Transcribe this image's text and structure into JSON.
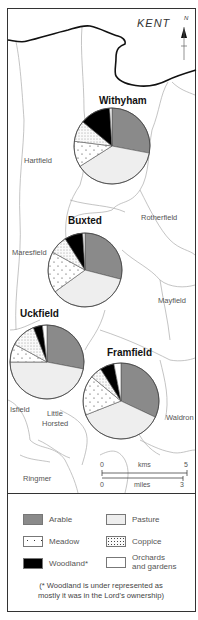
{
  "map": {
    "region_label": "KENT",
    "north_label": "N",
    "place_labels": [
      {
        "name": "Hartfield",
        "x": 24,
        "y": 163
      },
      {
        "name": "Rotherfield",
        "x": 141,
        "y": 220
      },
      {
        "name": "Maresfield",
        "x": 12,
        "y": 255
      },
      {
        "name": "Mayfield",
        "x": 158,
        "y": 303
      },
      {
        "name": "Waldron",
        "x": 166,
        "y": 420
      },
      {
        "name": "Isfield",
        "x": 10,
        "y": 412
      },
      {
        "name": "Little",
        "x": 47,
        "y": 416
      },
      {
        "name": "Horsted",
        "x": 42,
        "y": 426
      },
      {
        "name": "Ringmer",
        "x": 23,
        "y": 481
      }
    ],
    "scale": {
      "kms_label": "kms",
      "kms_start": "0",
      "kms_end": "5",
      "miles_label": "miles",
      "miles_start": "0",
      "miles_end": "3"
    }
  },
  "chart_data": {
    "type": "pie",
    "categories": [
      "Arable",
      "Pasture",
      "Meadow",
      "Coppice",
      "Woodland*",
      "Orchards and gardens"
    ],
    "colors": [
      "#8a8a8a",
      "#eeeeee",
      "#ffffff",
      "#f4f4f4",
      "#000000",
      "#ffffff"
    ],
    "series": [
      {
        "name": "Withyham",
        "values": [
          28,
          38,
          11,
          9,
          13,
          1
        ],
        "cx": 112,
        "cy": 146,
        "r": 38,
        "label_x": 99,
        "label_y": 104
      },
      {
        "name": "Buxted",
        "values": [
          29,
          36,
          18,
          8,
          8,
          1
        ],
        "cx": 85,
        "cy": 270,
        "r": 37,
        "label_x": 68,
        "label_y": 224
      },
      {
        "name": "Uckfield",
        "values": [
          28,
          47,
          8,
          11,
          4,
          2
        ],
        "cx": 47,
        "cy": 362,
        "r": 37,
        "label_x": 20,
        "label_y": 317
      },
      {
        "name": "Framfield",
        "values": [
          32,
          37,
          17,
          5,
          6,
          3
        ],
        "cx": 121,
        "cy": 401,
        "r": 38,
        "label_x": 107,
        "label_y": 356
      }
    ],
    "note": "Values are approximate percentages estimated from slice angles, clockwise from 12 o'clock."
  },
  "legend": {
    "items": [
      {
        "label": "Arable"
      },
      {
        "label": "Pasture"
      },
      {
        "label": "Meadow"
      },
      {
        "label": "Coppice"
      },
      {
        "label": "Woodland*"
      },
      {
        "label": "Orchards"
      },
      {
        "label": "and gardens"
      }
    ],
    "note_line1": "(* Woodland is under represented as",
    "note_line2": "mostly it was in the Lord's ownership)"
  }
}
